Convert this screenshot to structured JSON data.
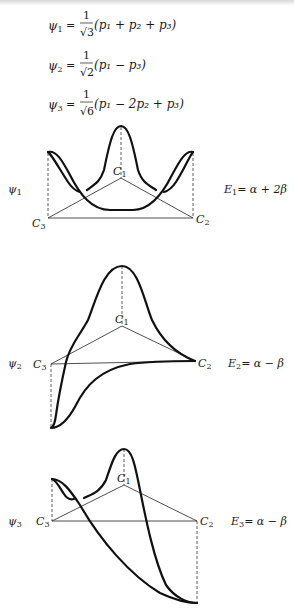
{
  "equations": [
    {
      "lhs": "ψ",
      "lhs_sub": "1",
      "numerator": "1",
      "denominator": "√3",
      "rhs": "(p₁ + p₂ + p₃)"
    },
    {
      "lhs": "ψ",
      "lhs_sub": "2",
      "numerator": "1",
      "denominator": "√2",
      "rhs": "(p₁ − p₃)"
    },
    {
      "lhs": "ψ",
      "lhs_sub": "3",
      "numerator": "1",
      "denominator": "√6",
      "rhs": "(p₁ − 2p₂ + p₃)"
    }
  ],
  "orbitals": [
    {
      "label": "ψ",
      "label_sub": "1",
      "atoms": {
        "c1": "C",
        "c1_sub": "1",
        "c2": "C",
        "c2_sub": "2",
        "c3": "C",
        "c3_sub": "3"
      },
      "energy": {
        "lhs": "E",
        "lhs_sub": "1",
        "rhs": "= α + 2β"
      }
    },
    {
      "label": "ψ",
      "label_sub": "2",
      "atoms": {
        "c1": "C",
        "c1_sub": "1",
        "c2": "C",
        "c2_sub": "2",
        "c3": "C",
        "c3_sub": "3"
      },
      "energy": {
        "lhs": "E",
        "lhs_sub": "2",
        "rhs": "= α − β"
      }
    },
    {
      "label": "ψ",
      "label_sub": "3",
      "atoms": {
        "c1": "C",
        "c1_sub": "1",
        "c2": "C",
        "c2_sub": "2",
        "c3": "C",
        "c3_sub": "3"
      },
      "energy": {
        "lhs": "E",
        "lhs_sub": "3",
        "rhs": "= α − β"
      }
    }
  ]
}
